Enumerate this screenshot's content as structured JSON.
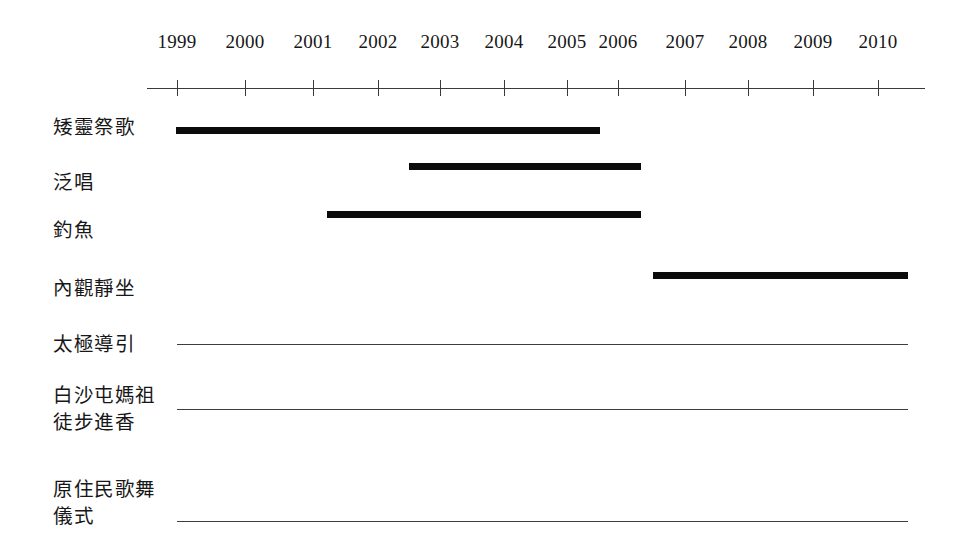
{
  "chart_data": {
    "type": "bar",
    "orientation": "horizontal-timeline",
    "title": "",
    "subtitle": "",
    "xlabel": "",
    "ylabel": "",
    "grid": false,
    "legend": null,
    "axis": {
      "tick_labels": [
        "1999",
        "2000",
        "2001",
        "2002",
        "2003",
        "2004",
        "2005",
        "2006",
        "2007",
        "2008",
        "2009",
        "2010"
      ],
      "xlim": [
        1999,
        2010
      ],
      "tick_positions_px": [
        177,
        245,
        313,
        378,
        440,
        504,
        567,
        618,
        685,
        748,
        813,
        878
      ],
      "axis_start_px": 147,
      "axis_end_px": 925,
      "axis_y_px": 88,
      "tick_half_height_px": 8
    },
    "categories": [
      "矮靈祭歌",
      "泛唱",
      "釣魚",
      "內觀靜坐",
      "太極導引",
      "白沙屯媽祖\n徒步進香",
      "原住民歌舞\n儀式"
    ],
    "rows": [
      {
        "label": "矮靈祭歌",
        "mark": "bar",
        "start_year": 1999.0,
        "end_year": 2005.5,
        "start_px": 176,
        "end_px": 600,
        "bar_y_px": 127,
        "label_x_px": 53,
        "label_y_px": 114
      },
      {
        "label": "泛唱",
        "mark": "bar",
        "start_year": 2002.5,
        "end_year": 2006.4,
        "start_px": 409,
        "end_px": 641,
        "bar_y_px": 163,
        "label_x_px": 53,
        "label_y_px": 169
      },
      {
        "label": "釣魚",
        "mark": "bar",
        "start_year": 2001.2,
        "end_year": 2006.4,
        "start_px": 327,
        "end_px": 641,
        "bar_y_px": 211,
        "label_x_px": 53,
        "label_y_px": 217
      },
      {
        "label": "內觀靜坐",
        "mark": "bar",
        "start_year": 2006.7,
        "end_year": 2010.5,
        "start_px": 653,
        "end_px": 908,
        "bar_y_px": 272,
        "label_x_px": 53,
        "label_y_px": 275
      },
      {
        "label": "太極導引",
        "mark": "rule",
        "start_year": 1999.0,
        "end_year": 2010.5,
        "start_px": 177,
        "end_px": 908,
        "bar_y_px": 344,
        "label_x_px": 53,
        "label_y_px": 331
      },
      {
        "label": "白沙屯媽祖\n徒步進香",
        "mark": "rule",
        "start_year": 1999.0,
        "end_year": 2010.5,
        "start_px": 177,
        "end_px": 908,
        "bar_y_px": 409,
        "label_x_px": 53,
        "label_y_px": 382
      },
      {
        "label": "原住民歌舞\n儀式",
        "mark": "rule",
        "start_year": 1999.0,
        "end_year": 2010.5,
        "start_px": 177,
        "end_px": 908,
        "bar_y_px": 521,
        "label_x_px": 53,
        "label_y_px": 476
      }
    ],
    "colors": {
      "bar": "#0b0b0b",
      "rule": "#3d3d3d",
      "axis": "#3a3a3a",
      "text": "#171717",
      "background": "#ffffff"
    }
  }
}
